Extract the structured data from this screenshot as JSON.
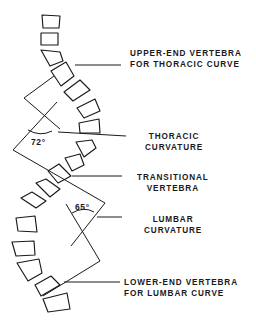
{
  "diagram": {
    "type": "scoliosis-cobb-angle-illustration",
    "labels": {
      "upper_end": {
        "line1": "UPPER-END VERTEBRA",
        "line2": "FOR THORACIC CURVE"
      },
      "thoracic_curvature": {
        "line1": "THORACIC",
        "line2": "CURVATURE"
      },
      "transitional": {
        "line1": "TRANSITIONAL",
        "line2": "VERTEBRA"
      },
      "lumbar_curvature": {
        "line1": "LUMBAR",
        "line2": "CURVATURE"
      },
      "lower_end": {
        "line1": "LOWER-END VERTEBRA",
        "line2": "FOR LUMBAR CURVE"
      }
    },
    "angles": {
      "thoracic": "72°",
      "lumbar": "65°"
    },
    "colors": {
      "ink": "#1a1a1a",
      "background": "#ffffff"
    }
  }
}
